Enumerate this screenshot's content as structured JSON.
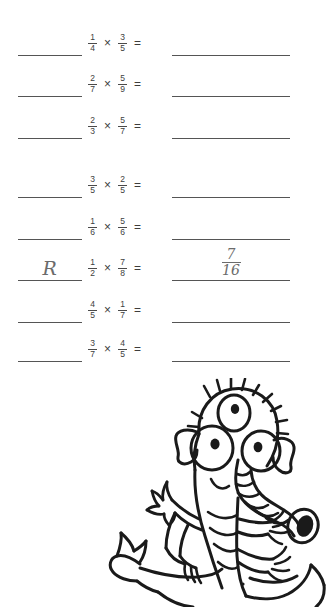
{
  "worksheet": {
    "background_color": "#ffffff",
    "rule_color": "#555555",
    "print_ink_color": "#3d3d3d",
    "handwriting_color": "#6b6b6b",
    "operator": "×",
    "equals": "=",
    "rows": [
      {
        "id": "row-1",
        "top": 22,
        "left_blank": "",
        "factor1": {
          "numerator": "1",
          "denominator": "4"
        },
        "factor2": {
          "numerator": "3",
          "denominator": "5"
        },
        "answer": {
          "numerator": "",
          "denominator": ""
        }
      },
      {
        "id": "row-2",
        "top": 63,
        "left_blank": "",
        "factor1": {
          "numerator": "2",
          "denominator": "7"
        },
        "factor2": {
          "numerator": "5",
          "denominator": "9"
        },
        "answer": {
          "numerator": "",
          "denominator": ""
        }
      },
      {
        "id": "row-3",
        "top": 105,
        "left_blank": "",
        "factor1": {
          "numerator": "2",
          "denominator": "3"
        },
        "factor2": {
          "numerator": "5",
          "denominator": "7"
        },
        "answer": {
          "numerator": "",
          "denominator": ""
        }
      },
      {
        "id": "row-4",
        "top": 164,
        "left_blank": "",
        "factor1": {
          "numerator": "3",
          "denominator": "5"
        },
        "factor2": {
          "numerator": "2",
          "denominator": "5"
        },
        "answer": {
          "numerator": "",
          "denominator": ""
        }
      },
      {
        "id": "row-5",
        "top": 206,
        "left_blank": "",
        "factor1": {
          "numerator": "1",
          "denominator": "6"
        },
        "factor2": {
          "numerator": "5",
          "denominator": "6"
        },
        "answer": {
          "numerator": "",
          "denominator": ""
        }
      },
      {
        "id": "row-6",
        "top": 247,
        "left_blank": "R",
        "factor1": {
          "numerator": "1",
          "denominator": "2"
        },
        "factor2": {
          "numerator": "7",
          "denominator": "8"
        },
        "answer": {
          "numerator": "7",
          "denominator": "16"
        }
      },
      {
        "id": "row-7",
        "top": 289,
        "left_blank": "",
        "factor1": {
          "numerator": "4",
          "denominator": "5"
        },
        "factor2": {
          "numerator": "1",
          "denominator": "7"
        },
        "answer": {
          "numerator": "",
          "denominator": ""
        }
      },
      {
        "id": "row-8",
        "top": 328,
        "left_blank": "",
        "factor1": {
          "numerator": "3",
          "denominator": "7"
        },
        "factor2": {
          "numerator": "4",
          "denominator": "5"
        },
        "answer": {
          "numerator": "",
          "denominator": ""
        }
      }
    ]
  },
  "illustration": {
    "name": "three-eyed-trunk-monster",
    "description": "Hand-drawn cartoon creature with three eyes, spiky hair, pointed ears, a ribbed elephant-like trunk, striped torso and three-fingered hands",
    "ink_color": "#1a1a1a"
  }
}
